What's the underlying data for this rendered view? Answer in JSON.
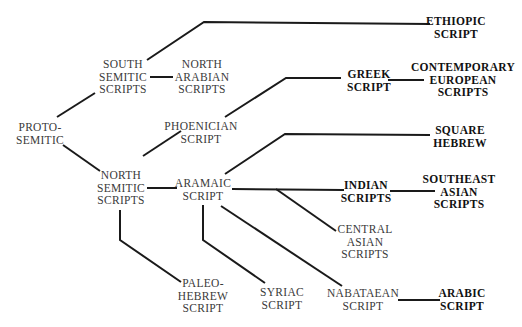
{
  "diagram": {
    "title": "",
    "nodes": [
      {
        "id": "proto_semitic",
        "lines": [
          "PROTO-",
          "SEMITIC"
        ],
        "x": 40,
        "y": 133,
        "bold": false
      },
      {
        "id": "south_semitic",
        "lines": [
          "SOUTH",
          "SEMITIC",
          "SCRIPTS"
        ],
        "x": 123,
        "y": 77,
        "bold": false
      },
      {
        "id": "north_arabian",
        "lines": [
          "NORTH",
          "ARABIAN",
          "SCRIPTS"
        ],
        "x": 202,
        "y": 77,
        "bold": false
      },
      {
        "id": "ethiopic",
        "lines": [
          "ETHIOPIC",
          "SCRIPT"
        ],
        "x": 456,
        "y": 27,
        "bold": true
      },
      {
        "id": "phoenician",
        "lines": [
          "PHOENICIAN",
          "SCRIPT"
        ],
        "x": 201,
        "y": 132,
        "bold": false
      },
      {
        "id": "greek",
        "lines": [
          "GREEK",
          "SCRIPT"
        ],
        "x": 369,
        "y": 80,
        "bold": true
      },
      {
        "id": "contemporary_european",
        "lines": [
          "CONTEMPORARY",
          "EUROPEAN",
          "SCRIPTS"
        ],
        "x": 463,
        "y": 80,
        "bold": true
      },
      {
        "id": "north_semitic",
        "lines": [
          "NORTH",
          "SEMITIC",
          "SCRIPTS"
        ],
        "x": 121,
        "y": 188,
        "bold": false
      },
      {
        "id": "aramaic",
        "lines": [
          "ARAMAIC",
          "SCRIPT"
        ],
        "x": 203,
        "y": 189,
        "bold": false
      },
      {
        "id": "square_hebrew",
        "lines": [
          "SQUARE",
          "HEBREW"
        ],
        "x": 460,
        "y": 136,
        "bold": true
      },
      {
        "id": "indian",
        "lines": [
          "INDIAN",
          "SCRIPTS"
        ],
        "x": 366,
        "y": 191,
        "bold": true
      },
      {
        "id": "southeast_asian",
        "lines": [
          "SOUTHEAST",
          "ASIAN",
          "SCRIPTS"
        ],
        "x": 459,
        "y": 192,
        "bold": true
      },
      {
        "id": "central_asian",
        "lines": [
          "CENTRAL",
          "ASIAN",
          "SCRIPTS"
        ],
        "x": 365,
        "y": 242,
        "bold": false
      },
      {
        "id": "paleo_hebrew",
        "lines": [
          "PALEO-",
          "HEBREW",
          "SCRIPT"
        ],
        "x": 203,
        "y": 296,
        "bold": false
      },
      {
        "id": "syriac",
        "lines": [
          "SYRIAC",
          "SCRIPT"
        ],
        "x": 282,
        "y": 298,
        "bold": false
      },
      {
        "id": "nabataean",
        "lines": [
          "NABATAEAN",
          "SCRIPT"
        ],
        "x": 363,
        "y": 299,
        "bold": false
      },
      {
        "id": "arabic",
        "lines": [
          "ARABIC",
          "SCRIPT"
        ],
        "x": 462,
        "y": 299,
        "bold": true
      }
    ],
    "edges": [
      {
        "from": "proto_semitic",
        "to": "south_semitic",
        "points": "57,117 95,93"
      },
      {
        "from": "proto_semitic",
        "to": "north_semitic",
        "points": "63,145 100,171"
      },
      {
        "from": "south_semitic",
        "to": "ethiopic",
        "points": "147,60 204,22 430,24"
      },
      {
        "from": "south_semitic",
        "to": "north_arabian",
        "points": "150,77 173,77"
      },
      {
        "from": "north_semitic",
        "to": "phoenician",
        "points": "143,156 181,131"
      },
      {
        "from": "phoenician",
        "to": "greek",
        "points": "225,117 286,78 341,78"
      },
      {
        "from": "greek",
        "to": "contemporary_european",
        "points": "388,80 424,80"
      },
      {
        "from": "north_semitic",
        "to": "aramaic",
        "points": "147,188 177,188"
      },
      {
        "from": "north_semitic",
        "to": "paleo_hebrew",
        "points": "120,210 120,240 181,282"
      },
      {
        "from": "aramaic",
        "to": "square_hebrew",
        "points": "225,174 285,134 430,135"
      },
      {
        "from": "aramaic",
        "to": "indian",
        "points": "232,189 344,190"
      },
      {
        "from": "indian",
        "to": "southeast_asian",
        "points": "390,191 435,191"
      },
      {
        "from": "aramaic",
        "to": "central_asian",
        "points": "276,189 336,231"
      },
      {
        "from": "aramaic",
        "to": "syriac",
        "points": "203,205 203,240 265,283"
      },
      {
        "from": "aramaic",
        "to": "nabataean",
        "points": "221,206 342,286"
      },
      {
        "from": "nabataean",
        "to": "arabic",
        "points": "398,300 440,300"
      }
    ]
  }
}
